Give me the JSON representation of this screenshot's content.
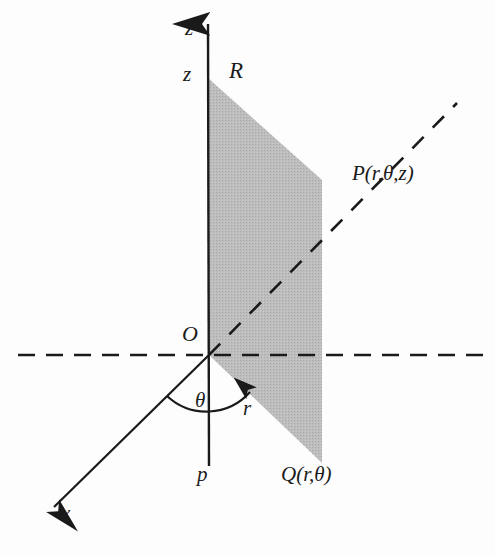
{
  "figure": {
    "width": 495,
    "height": 557,
    "background_color": "#fdfdfd"
  },
  "colors": {
    "line": "#1a1a1a",
    "plane_fill": "#b8b8b8",
    "plane_fill_alt": "#c4c4c4",
    "text": "#1a1a1a",
    "background": "#fdfdfd"
  },
  "labels": {
    "z_axis": "z",
    "z_height": "z",
    "R": "R",
    "P": "P(r,θ,z)",
    "O": "O",
    "theta": "θ",
    "r": "r",
    "p": "p",
    "Q": "Q(r,θ)",
    "x": "x"
  },
  "geometry": {
    "origin": {
      "x": 209,
      "y": 355
    },
    "z_axis": {
      "name": "z-axis",
      "from": {
        "x": 209,
        "y": 465
      },
      "to": {
        "x": 208,
        "y": 22
      },
      "arrow": "up",
      "style": "solid"
    },
    "x_axis": {
      "name": "x-axis",
      "from": {
        "x": 209,
        "y": 355
      },
      "to": {
        "x": 52,
        "y": 509
      },
      "arrow": "down-left",
      "style": "solid"
    },
    "y_axis": {
      "name": "y-axis-dashed-horizontal",
      "from": {
        "x": 18,
        "y": 355
      },
      "to": {
        "x": 485,
        "y": 355
      },
      "style": "dashed"
    },
    "radial_line": {
      "name": "radial-dashed-line-to-P",
      "from": {
        "x": 209,
        "y": 355
      },
      "to": {
        "x": 457,
        "y": 103
      },
      "style": "dashed"
    },
    "plane": {
      "name": "vertical-half-plane",
      "points": [
        {
          "x": 208,
          "y": 78
        },
        {
          "x": 322,
          "y": 180
        },
        {
          "x": 322,
          "y": 463
        },
        {
          "x": 209,
          "y": 355
        }
      ],
      "fill": "#b8b8b8"
    },
    "theta_arc": {
      "name": "theta-angle-arc",
      "center": {
        "x": 209,
        "y": 355
      },
      "radius": 58,
      "start_angle_deg": 224,
      "end_angle_deg": 315,
      "arrow": "end"
    }
  }
}
